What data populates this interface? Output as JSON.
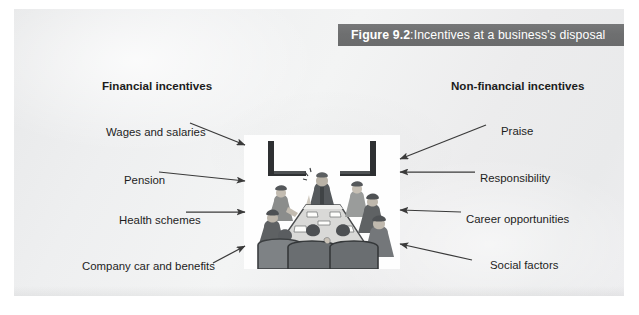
{
  "figure": {
    "caption_number": "Figure 9.2",
    "caption_separator": ":",
    "caption_text": " Incentives at a business's disposal",
    "caption_bar_color": "#6e6f70",
    "caption_text_color": "#ffffff",
    "panel_background_color": "#eceded",
    "illustration_background_color": "#fefefe",
    "label_text_color": "#1d1d1d"
  },
  "columns": {
    "left_heading": "Financial incentives",
    "right_heading": "Non-financial incentives"
  },
  "financial_incentives": [
    {
      "label": "Wages and salaries"
    },
    {
      "label": "Pension"
    },
    {
      "label": "Health schemes"
    },
    {
      "label": "Company car and benefits"
    }
  ],
  "non_financial_incentives": [
    {
      "label": "Praise"
    },
    {
      "label": "Responsibility"
    },
    {
      "label": "Career opportunities"
    },
    {
      "label": "Social factors"
    }
  ],
  "illustration": {
    "description": "Boardroom meeting illustration",
    "scene": "people seated around a trapezoid conference table with a speaker at the head"
  }
}
